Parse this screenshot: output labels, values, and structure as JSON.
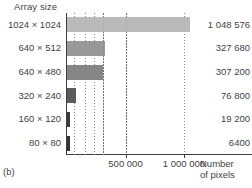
{
  "figure": {
    "panel_letter": "(b)",
    "y_axis_title": "Array size",
    "x_axis_caption_line1": "Number",
    "x_axis_caption_line2": "of pixels"
  },
  "chart_data": {
    "type": "bar",
    "orientation": "horizontal",
    "title": "Array size",
    "xlabel": "Number of pixels",
    "ylabel": "Array size",
    "xlim": [
      0,
      1200000
    ],
    "grid": true,
    "legend": "none",
    "categories": [
      "1024 × 1024",
      "640 × 512",
      "640 × 480",
      "320 × 240",
      "160 × 120",
      "80 × 80"
    ],
    "values": [
      1048576,
      327680,
      307200,
      76800,
      19200,
      6400
    ],
    "value_labels": [
      "1 048 576",
      "327 680",
      "307 200",
      "76 800",
      "19 200",
      "6400"
    ],
    "bar_colors": [
      "#b4b4b4",
      "#8f8f8f",
      "#7c7c7c",
      "#5c5c5c",
      "#3c3c3c",
      "#343434"
    ],
    "xticks": [
      500000,
      1000000
    ],
    "xtick_labels": [
      "500 000",
      "1 000 000"
    ],
    "gridline_values": [
      60000,
      150000,
      230000,
      310000,
      500000,
      1000000
    ]
  }
}
